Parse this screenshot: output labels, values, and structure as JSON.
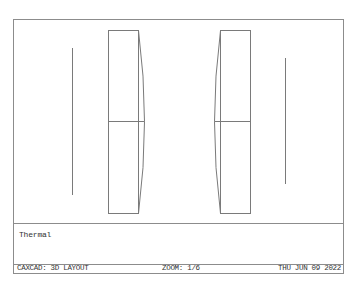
{
  "viewport": {
    "frame_color": "#8c8c8c",
    "line_color": "#7a7a7a",
    "background": "#ffffff"
  },
  "drawing": {
    "elements": [
      {
        "type": "line",
        "name": "left-plane-line",
        "x": 58,
        "y1": 28,
        "y2": 175
      },
      {
        "type": "lens",
        "name": "left-lens",
        "x_left": 94,
        "x_right": 124,
        "curve_peak_x": 130,
        "curve_side": "right",
        "y_top": 10,
        "y_mid": 101,
        "y_bottom": 193
      },
      {
        "type": "lens",
        "name": "right-lens",
        "x_left": 206,
        "x_right": 236,
        "curve_peak_x": 200,
        "curve_side": "left",
        "y_top": 10,
        "y_mid": 101,
        "y_bottom": 193
      },
      {
        "type": "line",
        "name": "right-plane-line",
        "x": 271,
        "y1": 38,
        "y2": 164
      }
    ]
  },
  "text_area": {
    "text": "Thermal"
  },
  "status_bar": {
    "app_mode": "CAXCAD: 3D LAYOUT",
    "zoom": "ZOOM: 1/6",
    "date": "THU JUN 09 2022"
  }
}
